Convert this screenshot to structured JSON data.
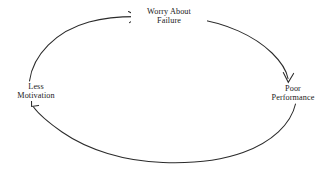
{
  "diagram": {
    "type": "cycle-diagram",
    "title": "",
    "background_color": "#ffffff",
    "stroke_color": "#2b2b2b",
    "text_color": "#1a1a1a",
    "nodes": [
      {
        "id": "worry-about-failure",
        "lines": [
          "Worry About",
          "Failure"
        ],
        "position": "top"
      },
      {
        "id": "poor-performance",
        "lines": [
          "Poor",
          "Performance"
        ],
        "position": "right"
      },
      {
        "id": "less-motivation",
        "lines": [
          "Less",
          "Motivation"
        ],
        "position": "left"
      }
    ],
    "arrows": [
      {
        "id": "motivation-to-worry",
        "from": "less-motivation",
        "to": "worry-about-failure",
        "direction": "clockwise",
        "arrowhead": "pointing-right-up"
      },
      {
        "id": "worry-to-performance",
        "from": "worry-about-failure",
        "to": "poor-performance",
        "direction": "clockwise",
        "arrowhead": "pointing-down"
      },
      {
        "id": "performance-to-motivation",
        "from": "poor-performance",
        "to": "less-motivation",
        "direction": "clockwise",
        "arrowhead": "pointing-up-left"
      }
    ]
  }
}
